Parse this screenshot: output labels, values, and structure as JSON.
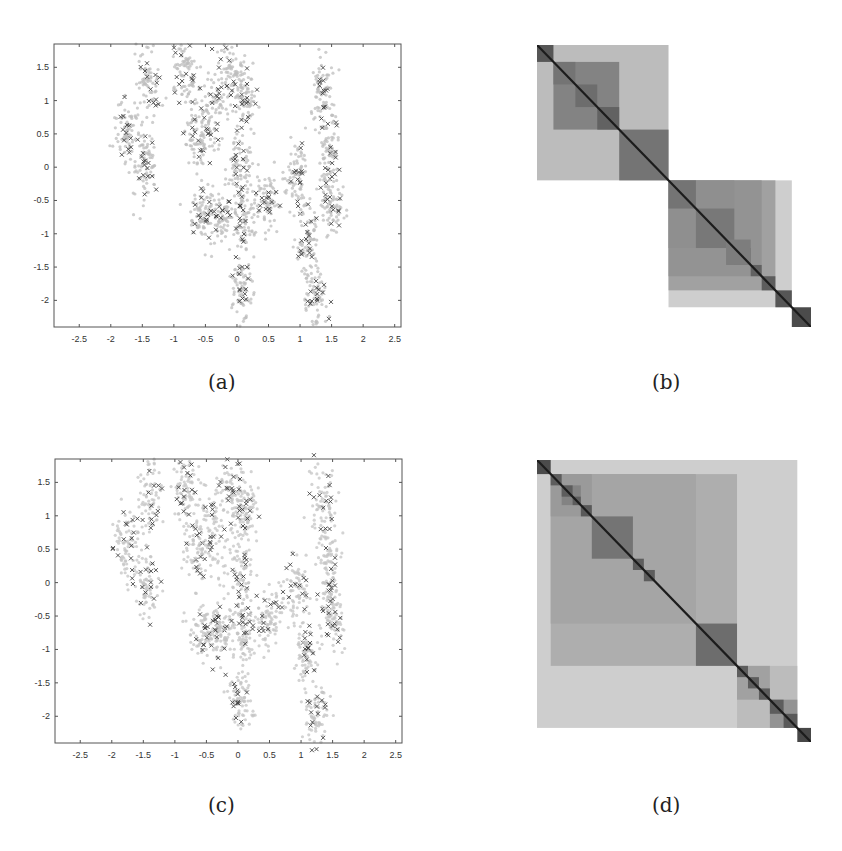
{
  "figure": {
    "panels": [
      {
        "id": "a",
        "caption": "(a)",
        "kind": "scatter"
      },
      {
        "id": "b",
        "caption": "(b)",
        "kind": "block-matrix"
      },
      {
        "id": "c",
        "caption": "(c)",
        "kind": "scatter"
      },
      {
        "id": "d",
        "caption": "(d)",
        "kind": "block-matrix"
      }
    ]
  },
  "chart_data": [
    {
      "panel": "a",
      "type": "scatter",
      "title": "",
      "xlabel": "",
      "ylabel": "",
      "xlim": [
        -2.9,
        2.6
      ],
      "ylim": [
        -2.4,
        1.85
      ],
      "xticks": [
        -2.5,
        -2,
        -1.5,
        -1,
        -0.5,
        0,
        0.5,
        1,
        1.5,
        2,
        2.5
      ],
      "xtick_labels": [
        "-2.5",
        "-2",
        "-1.5",
        "-1",
        "-0.5",
        "0",
        "0.5",
        "1",
        "1.5",
        "2",
        "2.5"
      ],
      "yticks": [
        1.5,
        1,
        0.5,
        0,
        -0.5,
        -1,
        -1.5,
        -2
      ],
      "ytick_labels": [
        "1.5",
        "1",
        "0.5",
        "0",
        "-0.5",
        "-1",
        "-1.5",
        "-2"
      ],
      "grid": false,
      "series": [
        {
          "name": "data points",
          "marker": "dot",
          "color": "#bdbdbd"
        },
        {
          "name": "selected points",
          "marker": "x",
          "color": "#444444"
        }
      ],
      "clusters": [
        {
          "x": -1.75,
          "y": 0.55,
          "sx": 0.1,
          "sy": 0.25
        },
        {
          "x": -1.4,
          "y": 1.3,
          "sx": 0.1,
          "sy": 0.3
        },
        {
          "x": -1.45,
          "y": 0.0,
          "sx": 0.1,
          "sy": 0.25
        },
        {
          "x": -0.85,
          "y": 1.4,
          "sx": 0.1,
          "sy": 0.25
        },
        {
          "x": -0.65,
          "y": 0.5,
          "sx": 0.1,
          "sy": 0.28
        },
        {
          "x": -0.55,
          "y": -0.7,
          "sx": 0.1,
          "sy": 0.2
        },
        {
          "x": -0.28,
          "y": -0.7,
          "sx": 0.09,
          "sy": 0.2
        },
        {
          "x": -0.4,
          "y": 0.85,
          "sx": 0.12,
          "sy": 0.35
        },
        {
          "x": -0.1,
          "y": 1.35,
          "sx": 0.12,
          "sy": 0.25
        },
        {
          "x": 0.12,
          "y": 1.0,
          "sx": 0.1,
          "sy": 0.25
        },
        {
          "x": 0.05,
          "y": 0.0,
          "sx": 0.1,
          "sy": 0.3
        },
        {
          "x": 0.1,
          "y": -0.75,
          "sx": 0.1,
          "sy": 0.25
        },
        {
          "x": 0.5,
          "y": -0.55,
          "sx": 0.1,
          "sy": 0.2
        },
        {
          "x": 0.95,
          "y": -0.15,
          "sx": 0.1,
          "sy": 0.25
        },
        {
          "x": 1.1,
          "y": -1.05,
          "sx": 0.09,
          "sy": 0.25
        },
        {
          "x": 1.35,
          "y": 1.15,
          "sx": 0.1,
          "sy": 0.28
        },
        {
          "x": 1.45,
          "y": 0.2,
          "sx": 0.09,
          "sy": 0.3
        },
        {
          "x": 1.5,
          "y": -0.55,
          "sx": 0.09,
          "sy": 0.25
        },
        {
          "x": 0.05,
          "y": -1.8,
          "sx": 0.09,
          "sy": 0.25
        },
        {
          "x": 1.25,
          "y": -2.0,
          "sx": 0.1,
          "sy": 0.25
        }
      ]
    },
    {
      "panel": "b",
      "type": "heatmap",
      "title": "",
      "description": "Reordered similarity matrix with nested diagonal block structure (grayscale; darker = more similar)",
      "colorscale": [
        "#ffffff",
        "#1a1a1a"
      ],
      "size": 100,
      "blocks": [
        {
          "start": 0,
          "end": 48,
          "level": 0.3
        },
        {
          "start": 6,
          "end": 30,
          "level": 0.55
        },
        {
          "start": 30,
          "end": 48,
          "level": 0.62
        },
        {
          "start": 0,
          "end": 6,
          "level": 0.75
        },
        {
          "start": 6,
          "end": 14,
          "level": 0.62
        },
        {
          "start": 14,
          "end": 22,
          "level": 0.65
        },
        {
          "start": 22,
          "end": 30,
          "level": 0.7
        },
        {
          "start": 48,
          "end": 93,
          "level": 0.22
        },
        {
          "start": 48,
          "end": 87,
          "level": 0.42
        },
        {
          "start": 48,
          "end": 82,
          "level": 0.48
        },
        {
          "start": 48,
          "end": 72,
          "level": 0.5
        },
        {
          "start": 48,
          "end": 58,
          "level": 0.62
        },
        {
          "start": 58,
          "end": 72,
          "level": 0.6
        },
        {
          "start": 72,
          "end": 78,
          "level": 0.65
        },
        {
          "start": 69,
          "end": 78,
          "level": 0.58
        },
        {
          "start": 78,
          "end": 82,
          "level": 0.7
        },
        {
          "start": 82,
          "end": 87,
          "level": 0.72
        },
        {
          "start": 87,
          "end": 93,
          "level": 0.75
        },
        {
          "start": 93,
          "end": 100,
          "level": 0.8
        }
      ]
    },
    {
      "panel": "c",
      "type": "scatter",
      "title": "",
      "xlabel": "",
      "ylabel": "",
      "xlim": [
        -2.9,
        2.6
      ],
      "ylim": [
        -2.4,
        1.85
      ],
      "xticks": [
        -2.5,
        -2,
        -1.5,
        -1,
        -0.5,
        0,
        0.5,
        1,
        1.5,
        2,
        2.5
      ],
      "xtick_labels": [
        "-2.5",
        "-2",
        "-1.5",
        "-1",
        "-0.5",
        "0",
        "0.5",
        "1",
        "1.5",
        "2",
        "2.5"
      ],
      "yticks": [
        1.5,
        1,
        0.5,
        0,
        -0.5,
        -1,
        -1.5,
        -2
      ],
      "ytick_labels": [
        "1.5",
        "1",
        "0.5",
        "0",
        "-0.5",
        "-1",
        "-1.5",
        "-2"
      ],
      "grid": false,
      "series": [
        {
          "name": "data points",
          "marker": "dot",
          "color": "#c4c4c4"
        },
        {
          "name": "selected points",
          "marker": "x",
          "color": "#444444"
        }
      ],
      "outliers": [
        {
          "x": -0.4,
          "y": -1.3
        }
      ]
    },
    {
      "panel": "d",
      "type": "heatmap",
      "title": "",
      "description": "Reordered similarity matrix with nested diagonal block structure (grayscale; darker = more similar)",
      "colorscale": [
        "#ffffff",
        "#1a1a1a"
      ],
      "size": 100,
      "blocks": [
        {
          "start": 0,
          "end": 95,
          "level": 0.22
        },
        {
          "start": 5,
          "end": 73,
          "level": 0.36
        },
        {
          "start": 5,
          "end": 58,
          "level": 0.4
        },
        {
          "start": 5,
          "end": 20,
          "level": 0.45
        },
        {
          "start": 9,
          "end": 16,
          "level": 0.55
        },
        {
          "start": 20,
          "end": 35,
          "level": 0.62
        },
        {
          "start": 58,
          "end": 73,
          "level": 0.65
        },
        {
          "start": 73,
          "end": 95,
          "level": 0.3
        },
        {
          "start": 73,
          "end": 85,
          "level": 0.42
        },
        {
          "start": 85,
          "end": 95,
          "level": 0.48
        },
        {
          "start": 0,
          "end": 5,
          "level": 0.8
        },
        {
          "start": 5,
          "end": 9,
          "level": 0.72
        },
        {
          "start": 9,
          "end": 13,
          "level": 0.72
        },
        {
          "start": 13,
          "end": 16,
          "level": 0.72
        },
        {
          "start": 16,
          "end": 20,
          "level": 0.74
        },
        {
          "start": 35,
          "end": 39,
          "level": 0.72
        },
        {
          "start": 39,
          "end": 43,
          "level": 0.72
        },
        {
          "start": 73,
          "end": 77,
          "level": 0.72
        },
        {
          "start": 77,
          "end": 81,
          "level": 0.72
        },
        {
          "start": 81,
          "end": 85,
          "level": 0.72
        },
        {
          "start": 85,
          "end": 90,
          "level": 0.72
        },
        {
          "start": 90,
          "end": 95,
          "level": 0.74
        },
        {
          "start": 95,
          "end": 100,
          "level": 0.82
        }
      ]
    }
  ]
}
